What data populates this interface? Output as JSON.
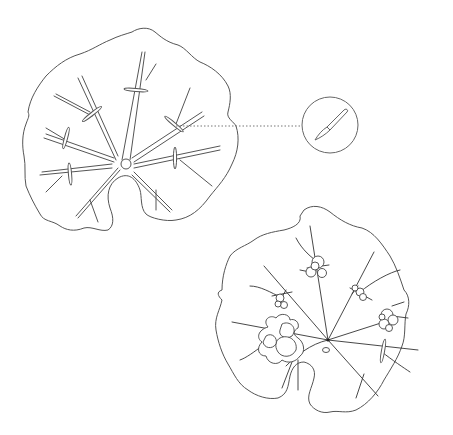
{
  "figure": {
    "line_color": "#555555",
    "background": "#ffffff"
  },
  "leaf_cut": {
    "name": "leaf with cut veins",
    "cuts": 9,
    "center": [
      126,
      164
    ]
  },
  "callout": {
    "icon": "scalpel-icon",
    "center": [
      330,
      125
    ],
    "radius": 28,
    "connector": "dotted"
  },
  "leaf_growth": {
    "name": "leaf with plantlets",
    "plantlets": 5,
    "center": [
      328,
      340
    ]
  }
}
